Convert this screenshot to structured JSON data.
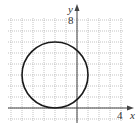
{
  "chart_data": {
    "type": "line",
    "title": "",
    "xlabel": "x",
    "ylabel": "y",
    "x_tick_labels": [
      {
        "value": 4,
        "label": "4"
      }
    ],
    "y_tick_labels": [
      {
        "value": 8,
        "label": "8"
      }
    ],
    "xlim": [
      -6,
      4
    ],
    "ylim": [
      -1,
      8
    ],
    "grid": true,
    "grid_step": 1,
    "series": [
      {
        "name": "circle",
        "shape": "circle",
        "center": [
          -2,
          3
        ],
        "radius": 3,
        "equation": "(x + 2)^2 + (y - 3)^2 = 9"
      }
    ]
  },
  "labels": {
    "x_axis": "x",
    "y_axis": "y",
    "x_tick": "4",
    "y_tick": "8"
  },
  "colors": {
    "grid": "#9a9a9a",
    "axis": "#444444",
    "curve": "#1a1a1a",
    "background": "#ffffff"
  }
}
